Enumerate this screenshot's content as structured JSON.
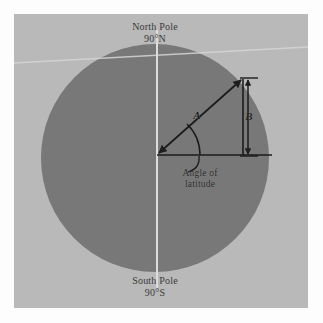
{
  "figure": {
    "panel_background": "#b9b9b9",
    "earth_fill": "#7a7a7a",
    "line_color": "#1e1e1e",
    "axis_color": "#d8d8d8"
  },
  "labels": {
    "north_pole_name": "North Pole",
    "north_pole_value": "90°N",
    "south_pole_name": "South Pole",
    "south_pole_value": "90°S",
    "angle_line1": "Angle of",
    "angle_line2": "latitude",
    "segment_a": "A",
    "segment_b": "B"
  },
  "geometry": {
    "circle_center_x": 155,
    "circle_center_y": 158,
    "circle_radius": 114,
    "vertex_x": 157,
    "vertex_y": 155,
    "hypotenuse_end_x": 243,
    "hypotenuse_end_y": 78,
    "baseline_end_x": 272,
    "dimension_line_x": 248,
    "dimension_top_y": 78,
    "dimension_bottom_y": 155
  }
}
